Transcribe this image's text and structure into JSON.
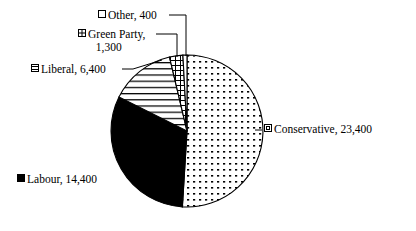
{
  "chart_data": {
    "type": "pie",
    "title": "",
    "subtitle": "",
    "categories": [
      "Conservative",
      "Labour",
      "Liberal",
      "Green Party",
      "Other"
    ],
    "values": [
      23400,
      14400,
      6400,
      1300,
      400
    ],
    "total": 45900,
    "legend_position": "data-labels-outside",
    "grid": false,
    "start_angle_deg": 0,
    "direction": "clockwise",
    "slices": [
      {
        "name": "Conservative",
        "value": 23400,
        "value_text": "23,400",
        "label_text": "Conservative, 23,400",
        "percent": 51.0,
        "start_angle_deg": 0.0,
        "end_angle_deg": 183.5,
        "fill_pattern": "dots",
        "marker": "dotted-square",
        "fill_color": "#ffffff",
        "stroke_color": "#000000"
      },
      {
        "name": "Labour",
        "value": 14400,
        "value_text": "14,400",
        "label_text": "Labour, 14,400",
        "percent": 31.4,
        "start_angle_deg": 183.5,
        "end_angle_deg": 296.5,
        "fill_pattern": "solid",
        "marker": "solid-square",
        "fill_color": "#000000",
        "stroke_color": "#000000"
      },
      {
        "name": "Liberal",
        "value": 6400,
        "value_text": "6,400",
        "label_text": "Liberal, 6,400",
        "percent": 13.9,
        "start_angle_deg": 296.5,
        "end_angle_deg": 346.7,
        "fill_pattern": "horizontal-lines",
        "marker": "horizontal-lines-square",
        "fill_color": "#ffffff",
        "stroke_color": "#000000"
      },
      {
        "name": "Green Party",
        "value": 1300,
        "value_text": "1,300",
        "label_text": "Green Party, 1,300",
        "percent": 2.8,
        "start_angle_deg": 346.7,
        "end_angle_deg": 356.9,
        "fill_pattern": "cross-hatch",
        "marker": "cross-square",
        "fill_color": "#ffffff",
        "stroke_color": "#000000"
      },
      {
        "name": "Other",
        "value": 400,
        "value_text": "400",
        "label_text": "Other, 400",
        "percent": 0.9,
        "start_angle_deg": 356.9,
        "end_angle_deg": 360.0,
        "fill_pattern": "blank",
        "marker": "blank-square",
        "fill_color": "#ffffff",
        "stroke_color": "#000000"
      }
    ],
    "xlabel": "",
    "ylabel": ""
  },
  "labels": {
    "other": "Other, 400",
    "green_party_line1": "Green Party,",
    "green_party_line2": "1,300",
    "liberal": "Liberal, 6,400",
    "conservative": "Conservative, 23,400",
    "labour": "Labour, 14,400"
  }
}
